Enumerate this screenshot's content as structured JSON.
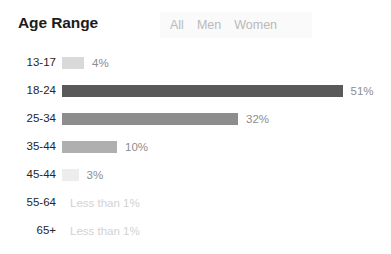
{
  "header": {
    "title": "Age Range",
    "segments": [
      {
        "label": "All"
      },
      {
        "label": "Men"
      },
      {
        "label": "Women"
      }
    ]
  },
  "chart_data": {
    "type": "bar",
    "orientation": "horizontal",
    "title": "Age Range",
    "xlabel": "",
    "ylabel": "",
    "xlim": [
      0,
      51
    ],
    "grid": false,
    "legend": null,
    "categories": [
      "13-17",
      "18-24",
      "25-34",
      "35-44",
      "45-44",
      "55-64",
      "65+"
    ],
    "values": [
      4,
      51,
      32,
      10,
      3,
      0,
      0
    ],
    "value_labels": [
      "4%",
      "51%",
      "32%",
      "10%",
      "3%",
      "Less than 1%",
      "Less than 1%"
    ],
    "bar_colors": [
      "#d9d9d9",
      "#595959",
      "#8d8d8d",
      "#afafaf",
      "#ededed",
      "#ffffff",
      "#ffffff"
    ],
    "rows": [
      {
        "label": "13-17",
        "value": 4,
        "value_label": "4%",
        "color": "#d9d9d9",
        "muted": false
      },
      {
        "label": "18-24",
        "value": 51,
        "value_label": "51%",
        "color": "#595959",
        "muted": false
      },
      {
        "label": "25-34",
        "value": 32,
        "value_label": "32%",
        "color": "#8d8d8d",
        "muted": false
      },
      {
        "label": "35-44",
        "value": 10,
        "value_label": "10%",
        "color": "#afafaf",
        "muted": false
      },
      {
        "label": "45-44",
        "value": 3,
        "value_label": "3%",
        "color": "#ededed",
        "muted": false
      },
      {
        "label": "55-64",
        "value": 0,
        "value_label": "Less than 1%",
        "color": "#ffffff",
        "muted": true
      },
      {
        "label": "65+",
        "value": 0,
        "value_label": "Less than 1%",
        "color": "#ffffff",
        "muted": true
      }
    ],
    "scale_px_per_percent": 5.5,
    "bar_origin_px": 62
  }
}
